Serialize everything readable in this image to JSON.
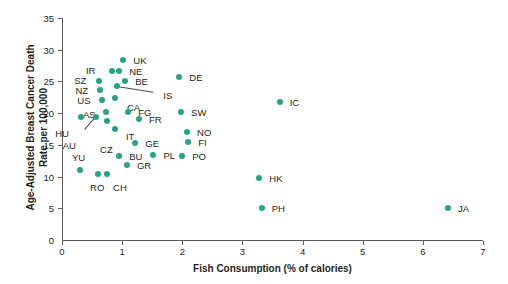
{
  "chart_data": {
    "type": "scatter",
    "title": "",
    "xlabel": "Fish Consumption (% of calories)",
    "ylabel": "Age-Adjusted Breast Cancer Death Rate per 100,000",
    "ylabel_line1": "Age-Adjusted Breast Cancer Death",
    "ylabel_line2": "Rate per 100,000",
    "xlim": [
      0,
      7
    ],
    "ylim": [
      0,
      35
    ],
    "xticks": [
      0,
      1,
      2,
      3,
      4,
      5,
      6,
      7
    ],
    "yticks": [
      0,
      5,
      10,
      15,
      20,
      25,
      30,
      35
    ],
    "xtick_labels": [
      "0",
      "1",
      "2",
      "3",
      "4",
      "5",
      "6",
      "7"
    ],
    "ytick_labels": [
      "0",
      "5",
      "10",
      "15",
      "20",
      "25",
      "30",
      "35"
    ],
    "grid": false,
    "legend": "none",
    "marker_color": "#26a383",
    "points": [
      {
        "label": "UK",
        "x": 1.02,
        "y": 28.4,
        "lx": 10,
        "ly": 0
      },
      {
        "label": "IR",
        "x": 0.83,
        "y": 26.6,
        "lx": -26,
        "ly": -1
      },
      {
        "label": "NE",
        "x": 0.95,
        "y": 26.6,
        "lx": 10,
        "ly": 0
      },
      {
        "label": "BE",
        "x": 1.05,
        "y": 25.1,
        "lx": 10,
        "ly": 0
      },
      {
        "label": "SZ",
        "x": 0.62,
        "y": 25.0,
        "lx": -25,
        "ly": -1
      },
      {
        "label": "NZ",
        "x": 0.64,
        "y": 23.7,
        "lx": -25,
        "ly": 0
      },
      {
        "label": "IS",
        "x": 0.92,
        "y": 24.3,
        "lx": 46,
        "ly": 9
      },
      {
        "label": "US",
        "x": 0.67,
        "y": 22.1,
        "lx": -25,
        "ly": 0
      },
      {
        "label": "CA",
        "x": 0.88,
        "y": 22.4,
        "lx": 12,
        "ly": 9
      },
      {
        "label": "AS",
        "x": 0.73,
        "y": 20.2,
        "lx": -23,
        "ly": 2
      },
      {
        "label": "FG",
        "x": 1.1,
        "y": 20.2,
        "lx": 10,
        "ly": 0
      },
      {
        "label": "FR",
        "x": 1.28,
        "y": 19.1,
        "lx": 10,
        "ly": 0
      },
      {
        "label": "HU",
        "x": 0.32,
        "y": 19.4,
        "lx": -26,
        "ly": 16
      },
      {
        "label": "AU",
        "x": 0.56,
        "y": 19.4,
        "lx": -33,
        "ly": 28
      },
      {
        "label": "CZ",
        "x": 0.75,
        "y": 18.8,
        "lx": -7,
        "ly": 28
      },
      {
        "label": "IT",
        "x": 0.88,
        "y": 17.5,
        "lx": 11,
        "ly": 7
      },
      {
        "label": "GE",
        "x": 1.22,
        "y": 15.3,
        "lx": 10,
        "ly": 0
      },
      {
        "label": "FI",
        "x": 2.1,
        "y": 15.5,
        "lx": 10,
        "ly": 0
      },
      {
        "label": "NO",
        "x": 2.08,
        "y": 17.1,
        "lx": 10,
        "ly": 0
      },
      {
        "label": "PL",
        "x": 1.52,
        "y": 13.4,
        "lx": 10,
        "ly": 0
      },
      {
        "label": "PO",
        "x": 2.0,
        "y": 13.3,
        "lx": 10,
        "ly": 0
      },
      {
        "label": "BU",
        "x": 0.95,
        "y": 13.3,
        "lx": 10,
        "ly": 0
      },
      {
        "label": "GR",
        "x": 1.08,
        "y": 11.9,
        "lx": 10,
        "ly": 0
      },
      {
        "label": "YU",
        "x": 0.3,
        "y": 11.0,
        "lx": -8,
        "ly": -13
      },
      {
        "label": "RO",
        "x": 0.6,
        "y": 10.4,
        "lx": -8,
        "ly": 13
      },
      {
        "label": "CH",
        "x": 0.75,
        "y": 10.4,
        "lx": 6,
        "ly": 13
      },
      {
        "label": "DE",
        "x": 1.95,
        "y": 25.7,
        "lx": 10,
        "ly": 0
      },
      {
        "label": "SW",
        "x": 1.98,
        "y": 20.2,
        "lx": 10,
        "ly": 0
      },
      {
        "label": "IC",
        "x": 3.62,
        "y": 21.7,
        "lx": 10,
        "ly": 0
      },
      {
        "label": "HK",
        "x": 3.28,
        "y": 9.7,
        "lx": 10,
        "ly": 0
      },
      {
        "label": "PH",
        "x": 3.32,
        "y": 5.1,
        "lx": 10,
        "ly": 0
      },
      {
        "label": "JA",
        "x": 6.42,
        "y": 5.1,
        "lx": 10,
        "ly": 0
      }
    ],
    "leaders": [
      {
        "name": "is-leader",
        "x1": 0.92,
        "y1": 24.3,
        "x2": 1.52,
        "y2": 23.4
      },
      {
        "name": "hu-leader",
        "x1": 0.56,
        "y1": 19.4,
        "x2": 0.38,
        "y2": 17.4
      }
    ]
  }
}
